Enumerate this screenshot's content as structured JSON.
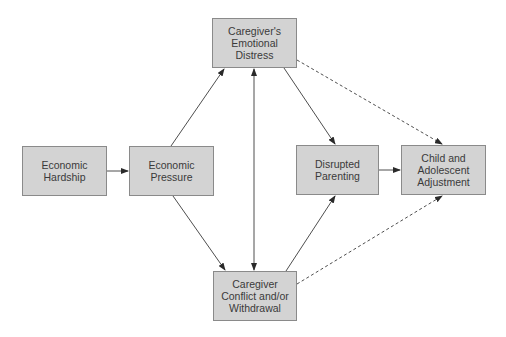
{
  "diagram": {
    "type": "path-model",
    "nodes": [
      {
        "id": "hardship",
        "label": "Economic\nHardship"
      },
      {
        "id": "pressure",
        "label": "Economic\nPressure"
      },
      {
        "id": "distress",
        "label": "Caregiver's\nEmotional\nDistress"
      },
      {
        "id": "conflict",
        "label": "Caregiver\nConflict and/or\nWithdrawal"
      },
      {
        "id": "parenting",
        "label": "Disrupted\nParenting"
      },
      {
        "id": "child",
        "label": "Child and\nAdolescent\nAdjustment"
      }
    ],
    "edges": [
      {
        "from": "hardship",
        "to": "pressure",
        "style": "solid"
      },
      {
        "from": "pressure",
        "to": "distress",
        "style": "solid"
      },
      {
        "from": "pressure",
        "to": "conflict",
        "style": "solid"
      },
      {
        "from": "distress",
        "to": "conflict",
        "style": "solid",
        "bidirectional": true
      },
      {
        "from": "distress",
        "to": "parenting",
        "style": "solid"
      },
      {
        "from": "conflict",
        "to": "parenting",
        "style": "solid"
      },
      {
        "from": "parenting",
        "to": "child",
        "style": "solid"
      },
      {
        "from": "distress",
        "to": "child",
        "style": "dashed"
      },
      {
        "from": "conflict",
        "to": "child",
        "style": "dashed"
      }
    ],
    "colors": {
      "node_fill": "#d3d3d3",
      "node_border": "#8a8a8a",
      "text": "#3a3a3a",
      "edge": "#3a3a3a"
    }
  }
}
